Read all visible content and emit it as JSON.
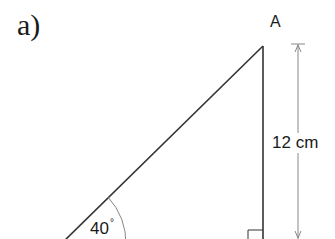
{
  "diagram": {
    "part_label": "a)",
    "vertex_label": "A",
    "side_length": "12 cm",
    "angle_value": "40",
    "angle_unit": "°",
    "shape": "right triangle",
    "colors": {
      "lines": "#333333",
      "dimension_line": "#888888",
      "text": "#1a1a1a"
    }
  }
}
